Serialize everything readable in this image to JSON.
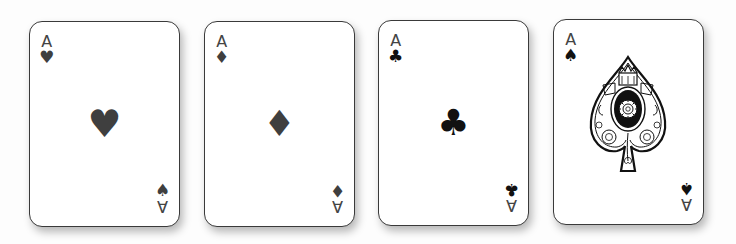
{
  "cards": [
    {
      "rank": "A",
      "suit": "hearts",
      "suit_glyph": "♥",
      "corner_bottom_glyph": "♠",
      "note": "bottom-right pip appears as spade (misprint)"
    },
    {
      "rank": "A",
      "suit": "diamonds",
      "suit_glyph": "♦",
      "corner_bottom_glyph": "♦"
    },
    {
      "rank": "A",
      "suit": "clubs",
      "suit_glyph": "♣",
      "corner_bottom_glyph": "♣"
    },
    {
      "rank": "A",
      "suit": "spades",
      "suit_glyph": "♠",
      "corner_bottom_glyph": "♠",
      "center": "ornate-spade"
    }
  ],
  "colors": {
    "ink_gray": "#3f3f3f",
    "ink_black": "#111111",
    "card_bg": "#ffffff",
    "page_bg": "#fdfdfd"
  }
}
